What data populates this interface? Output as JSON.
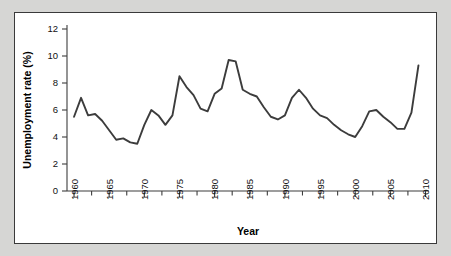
{
  "chart_data": {
    "type": "line",
    "title": "",
    "xlabel": "Year",
    "ylabel": "Unemployment rate (%)",
    "xlim": [
      1959.0,
      2010.5
    ],
    "ylim": [
      0,
      12
    ],
    "grid": false,
    "legend": null,
    "series_color": "#3c3c3c",
    "x_major_ticks": [
      1960,
      1965,
      1970,
      1975,
      1980,
      1985,
      1990,
      1995,
      2000,
      2005,
      2010
    ],
    "x_major_tick_labels": [
      "1960",
      "1965",
      "1970",
      "1975",
      "1980",
      "1985",
      "1990",
      "1995",
      "2000",
      "2005",
      "2010"
    ],
    "x_minor_tick_interval": 1,
    "y_major_ticks": [
      0,
      2,
      4,
      6,
      8,
      10,
      12
    ],
    "y_major_tick_labels": [
      "0",
      "2",
      "4",
      "6",
      "8",
      "10",
      "12"
    ],
    "x": [
      1960,
      1961,
      1962,
      1963,
      1964,
      1965,
      1966,
      1967,
      1968,
      1969,
      1970,
      1971,
      1972,
      1973,
      1974,
      1975,
      1976,
      1977,
      1978,
      1979,
      1980,
      1981,
      1982,
      1983,
      1984,
      1985,
      1986,
      1987,
      1988,
      1989,
      1990,
      1991,
      1992,
      1993,
      1994,
      1995,
      1996,
      1997,
      1998,
      1999,
      2000,
      2001,
      2002,
      2003,
      2004,
      2005,
      2006,
      2007,
      2008,
      2009
    ],
    "values": [
      5.5,
      6.9,
      5.6,
      5.7,
      5.2,
      4.5,
      3.8,
      3.9,
      3.6,
      3.5,
      4.9,
      6.0,
      5.6,
      4.9,
      5.6,
      8.5,
      7.7,
      7.1,
      6.1,
      5.9,
      7.2,
      7.6,
      9.7,
      9.6,
      7.5,
      7.2,
      7.0,
      6.2,
      5.5,
      5.3,
      5.6,
      6.9,
      7.5,
      6.9,
      6.1,
      5.6,
      5.4,
      4.9,
      4.5,
      4.2,
      4.0,
      4.8,
      5.9,
      6.0,
      5.5,
      5.1,
      4.6,
      4.6,
      5.8,
      9.3
    ]
  },
  "labels": {
    "x_axis_title": "Year",
    "y_axis_title": "Unemployment rate (%)"
  }
}
